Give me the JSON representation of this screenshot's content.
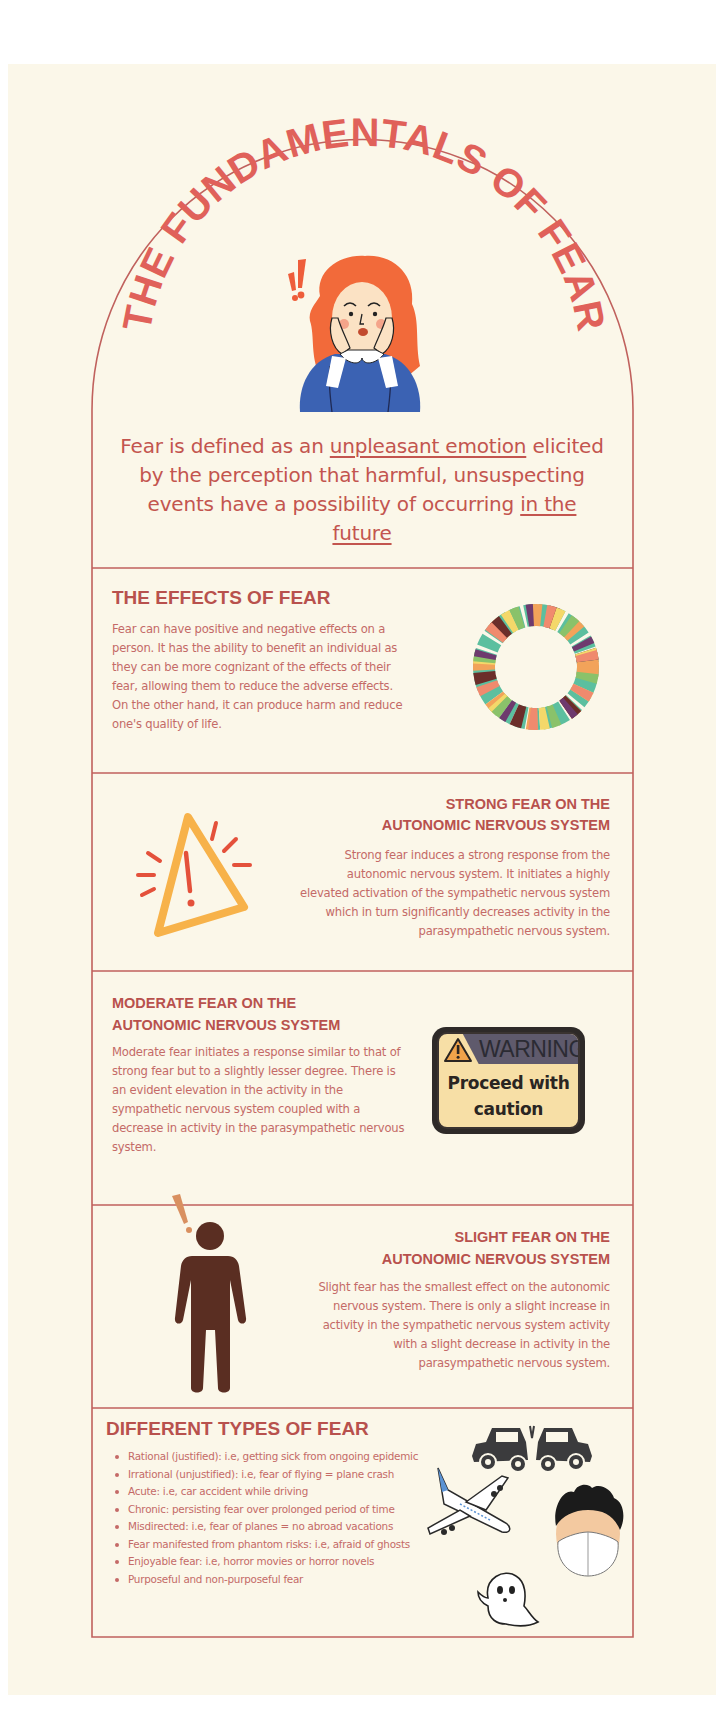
{
  "header": {
    "title": "THE FUNDAMENTALS OF FEAR",
    "definition": {
      "part1": "Fear is defined as an ",
      "link1": "unpleasant emotion",
      "part2": " elicited by the perception that harmful, unsuspecting events have a possibility of occurring ",
      "link2": "in the future"
    }
  },
  "sections": {
    "effects": {
      "title": "THE EFFECTS OF FEAR",
      "body": "Fear can have positive and negative effects on a person. It has the ability to benefit an individual as they can be more cognizant of the effects of their fear, allowing them to reduce the adverse effects. On the other hand, it can produce harm and reduce one's quality of life."
    },
    "strong": {
      "title_line1": "STRONG FEAR ON THE",
      "title_line2": "AUTONOMIC NERVOUS SYSTEM",
      "body": "Strong fear induces a strong response from the autonomic nervous system. It initiates a highly elevated activation of the sympathetic nervous system which in turn significantly decreases activity in the parasympathetic nervous system."
    },
    "moderate": {
      "title_line1": "MODERATE FEAR ON THE",
      "title_line2": "AUTONOMIC NERVOUS SYSTEM",
      "body": "Moderate fear initiates a response similar to that of strong fear but to a slightly lesser degree. There is an evident elevation in the activity in the sympathetic nervous system coupled with a decrease in activity in the parasympathetic nervous system.",
      "sign": {
        "header": "WARNING",
        "message_line1": "Proceed with",
        "message_line2": "caution"
      }
    },
    "slight": {
      "title_line1": "SLIGHT FEAR ON THE",
      "title_line2": "AUTONOMIC NERVOUS SYSTEM",
      "body": "Slight fear has the smallest effect on the autonomic nervous system. There is only a slight increase in activity in the sympathetic nervous system activity with a slight decrease in activity in the parasympathetic nervous system."
    },
    "types": {
      "title": "DIFFERENT TYPES OF FEAR",
      "items": [
        "Rational (justified): i.e, getting sick from ongoing epidemic",
        "Irrational (unjustified): i.e, fear of flying = plane crash",
        "Acute: i.e, car accident while driving",
        "Chronic: persisting fear over prolonged period of time",
        "Misdirected: i.e, fear of planes = no abroad vacations",
        "Fear manifested from phantom risks: i.e, afraid of ghosts",
        "Enjoyable fear: i.e, horror movies or horror novels",
        "Purposeful and non-purposeful fear"
      ]
    }
  },
  "icons": {
    "woman": "scared-woman-illustration",
    "ring": "ring-of-people-icon",
    "triangle": "warning-triangle-icon",
    "sign": "warning-sign-icon",
    "person": "alarmed-person-icon",
    "car": "car-crash-icon",
    "plane": "airplane-icon",
    "mask": "masked-face-icon",
    "ghost": "ghost-icon"
  },
  "colors": {
    "background": "#fbf7e9",
    "border": "#c0615d",
    "title": "#e0615a",
    "heading": "#b8514d",
    "body": "#c46a67"
  }
}
